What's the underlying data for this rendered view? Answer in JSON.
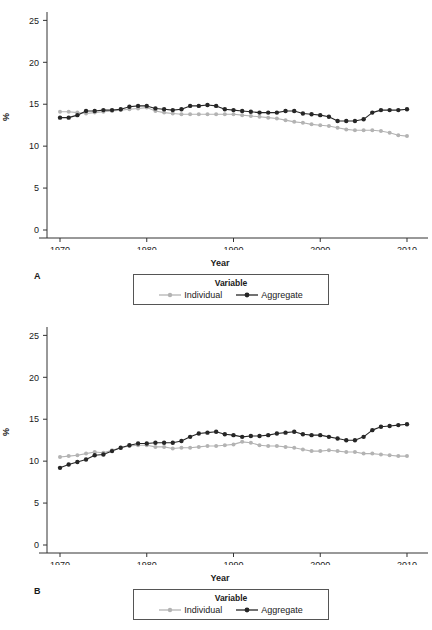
{
  "figure": {
    "panels": [
      {
        "id": "A",
        "letter": "A",
        "legend_title": "Variable",
        "legend": [
          {
            "label": "Individual",
            "color": "#b3b3b3",
            "key": "individual-key"
          },
          {
            "label": "Aggregate",
            "color": "#262626",
            "key": "aggregate-key"
          }
        ]
      },
      {
        "id": "B",
        "letter": "B",
        "legend_title": "Variable",
        "legend": [
          {
            "label": "Individual",
            "color": "#b3b3b3",
            "key": "individual-key"
          },
          {
            "label": "Aggregate",
            "color": "#262626",
            "key": "aggregate-key"
          }
        ]
      }
    ]
  },
  "chart_data": [
    {
      "panel": "A",
      "type": "line",
      "title": "",
      "xlabel": "Year",
      "ylabel": "%",
      "xlim": [
        1968.5,
        2011.5
      ],
      "ylim": [
        0,
        26
      ],
      "xticks": [
        1970,
        1980,
        1990,
        2000,
        2010
      ],
      "xticklabels": [
        "1970",
        "1980",
        "1990",
        "2000",
        "2010"
      ],
      "yticks": [
        0,
        5,
        10,
        15,
        20,
        25
      ],
      "yticklabels": [
        "0",
        "5",
        "10",
        "15",
        "20",
        "25"
      ],
      "grid": false,
      "legend_position": "below",
      "x": [
        1970,
        1971,
        1972,
        1973,
        1974,
        1975,
        1976,
        1977,
        1978,
        1979,
        1980,
        1981,
        1982,
        1983,
        1984,
        1985,
        1986,
        1987,
        1988,
        1989,
        1990,
        1991,
        1992,
        1993,
        1994,
        1995,
        1996,
        1997,
        1998,
        1999,
        2000,
        2001,
        2002,
        2003,
        2004,
        2005,
        2006,
        2007,
        2008,
        2009,
        2010
      ],
      "series": [
        {
          "name": "Individual",
          "color": "#b3b3b3",
          "values": [
            14.1,
            14.1,
            14.0,
            13.9,
            14.0,
            14.1,
            14.2,
            14.3,
            14.4,
            14.5,
            14.6,
            14.2,
            14.0,
            13.9,
            13.8,
            13.8,
            13.8,
            13.8,
            13.8,
            13.8,
            13.8,
            13.7,
            13.6,
            13.5,
            13.4,
            13.3,
            13.1,
            12.9,
            12.8,
            12.6,
            12.5,
            12.4,
            12.2,
            12.0,
            11.9,
            11.9,
            11.9,
            11.8,
            11.6,
            11.3,
            11.2
          ]
        },
        {
          "name": "Aggregate",
          "color": "#262626",
          "values": [
            13.4,
            13.4,
            13.7,
            14.2,
            14.2,
            14.3,
            14.3,
            14.4,
            14.7,
            14.8,
            14.8,
            14.5,
            14.4,
            14.3,
            14.4,
            14.8,
            14.8,
            14.9,
            14.8,
            14.4,
            14.3,
            14.2,
            14.1,
            14.0,
            14.0,
            14.0,
            14.2,
            14.2,
            13.9,
            13.8,
            13.7,
            13.5,
            13.0,
            13.0,
            13.0,
            13.2,
            14.0,
            14.3,
            14.3,
            14.3,
            14.4
          ]
        }
      ]
    },
    {
      "panel": "B",
      "type": "line",
      "title": "",
      "xlabel": "Year",
      "ylabel": "%",
      "xlim": [
        1968.5,
        2011.5
      ],
      "ylim": [
        0,
        26
      ],
      "xticks": [
        1970,
        1980,
        1990,
        2000,
        2010
      ],
      "xticklabels": [
        "1970",
        "1980",
        "1990",
        "2000",
        "2010"
      ],
      "yticks": [
        0,
        5,
        10,
        15,
        20,
        25
      ],
      "yticklabels": [
        "0",
        "5",
        "10",
        "15",
        "20",
        "25"
      ],
      "grid": false,
      "legend_position": "below",
      "x": [
        1970,
        1971,
        1972,
        1973,
        1974,
        1975,
        1976,
        1977,
        1978,
        1979,
        1980,
        1981,
        1982,
        1983,
        1984,
        1985,
        1986,
        1987,
        1988,
        1989,
        1990,
        1991,
        1992,
        1993,
        1994,
        1995,
        1996,
        1997,
        1998,
        1999,
        2000,
        2001,
        2002,
        2003,
        2004,
        2005,
        2006,
        2007,
        2008,
        2009,
        2010
      ],
      "series": [
        {
          "name": "Individual",
          "color": "#b3b3b3",
          "values": [
            10.5,
            10.6,
            10.7,
            10.9,
            11.1,
            11.0,
            11.3,
            11.6,
            11.8,
            11.9,
            11.9,
            11.7,
            11.7,
            11.5,
            11.6,
            11.6,
            11.7,
            11.8,
            11.8,
            11.9,
            12.0,
            12.3,
            12.2,
            11.9,
            11.8,
            11.8,
            11.7,
            11.6,
            11.4,
            11.2,
            11.2,
            11.3,
            11.2,
            11.1,
            11.1,
            10.9,
            10.9,
            10.8,
            10.7,
            10.6,
            10.6
          ]
        },
        {
          "name": "Aggregate",
          "color": "#262626",
          "values": [
            9.2,
            9.6,
            9.9,
            10.2,
            10.7,
            10.8,
            11.2,
            11.6,
            11.9,
            12.1,
            12.1,
            12.2,
            12.2,
            12.2,
            12.4,
            12.9,
            13.3,
            13.4,
            13.5,
            13.2,
            13.1,
            12.9,
            13.0,
            13.0,
            13.1,
            13.3,
            13.4,
            13.5,
            13.2,
            13.1,
            13.1,
            12.9,
            12.7,
            12.5,
            12.5,
            12.9,
            13.7,
            14.1,
            14.2,
            14.3,
            14.4
          ]
        }
      ]
    }
  ]
}
